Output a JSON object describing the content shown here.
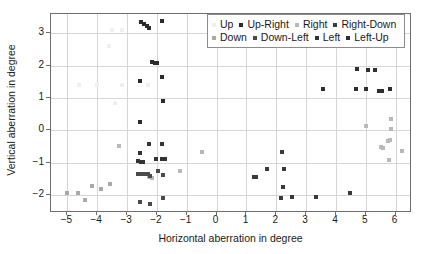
{
  "chart_data": {
    "type": "scatter",
    "title": "",
    "xlabel": "Horizontal aberration in degree",
    "ylabel": "Vertical aberration in degree",
    "xlim": [
      -5.55,
      6.55
    ],
    "ylim": [
      -2.55,
      3.6
    ],
    "xticks": [
      -5,
      -4,
      -3,
      -2,
      -1,
      0,
      1,
      2,
      3,
      4,
      5,
      6
    ],
    "xticklabels": [
      "−5",
      "−4",
      "−3",
      "−2",
      "−1",
      "0",
      "1",
      "2",
      "3",
      "4",
      "5",
      "6"
    ],
    "yticks": [
      -2,
      -1,
      0,
      1,
      2,
      3
    ],
    "yticklabels": [
      "−2",
      "−1",
      "0",
      "1",
      "2",
      "3"
    ],
    "grid": true,
    "legend_position": "upper right",
    "marker": "square",
    "series": [
      {
        "name": "Up",
        "color": "#efefef",
        "points": [
          [
            -3.52,
            3.1
          ],
          [
            -3.18,
            3.1
          ],
          [
            -3.6,
            2.62
          ],
          [
            -4.62,
            1.4
          ],
          [
            -4.02,
            1.4
          ],
          [
            -3.18,
            1.4
          ],
          [
            -2.3,
            1.4
          ],
          [
            -3.42,
            0.84
          ]
        ]
      },
      {
        "name": "Up-Right",
        "color": "#2b2b2b",
        "points": [
          [
            -2.52,
            3.34
          ],
          [
            -2.42,
            3.3
          ],
          [
            -2.34,
            3.24
          ],
          [
            -2.28,
            3.17
          ],
          [
            -1.82,
            3.38
          ],
          [
            -2.16,
            2.13
          ],
          [
            -2.08,
            2.09
          ],
          [
            -2.0,
            2.1
          ],
          [
            -2.56,
            1.52
          ],
          [
            -1.82,
            1.64
          ],
          [
            -1.8,
            0.9
          ],
          [
            -2.58,
            0.26
          ]
        ]
      },
      {
        "name": "Right",
        "color": "#b9b9b9",
        "points": [
          [
            -3.28,
            -0.49
          ],
          [
            -1.22,
            -1.24
          ],
          [
            -0.48,
            -0.66
          ],
          [
            -2.26,
            -1.44
          ],
          [
            -2.18,
            -1.47
          ],
          [
            5.02,
            0.13
          ],
          [
            5.86,
            0.36
          ],
          [
            5.84,
            0.06
          ],
          [
            5.8,
            -0.3
          ],
          [
            5.74,
            -0.33
          ],
          [
            5.52,
            -0.52
          ],
          [
            5.58,
            -0.55
          ],
          [
            6.22,
            -0.62
          ],
          [
            5.78,
            -0.92
          ]
        ]
      },
      {
        "name": "Right-Down",
        "color": "#3a3a3a",
        "points": [
          [
            2.18,
            -0.67
          ],
          [
            1.7,
            -1.19
          ],
          [
            2.26,
            -1.19
          ],
          [
            1.27,
            -1.44
          ],
          [
            1.31,
            -1.45
          ],
          [
            2.24,
            -1.76
          ],
          [
            2.16,
            -2.1
          ],
          [
            2.52,
            -2.06
          ],
          [
            3.34,
            -2.06
          ],
          [
            4.48,
            -1.94
          ]
        ]
      },
      {
        "name": "Down",
        "color": "#a9a9a9",
        "points": [
          [
            -5.02,
            -1.93
          ],
          [
            -4.66,
            -1.93
          ],
          [
            -4.42,
            -2.15
          ],
          [
            -4.16,
            -1.71
          ],
          [
            -3.88,
            -1.81
          ],
          [
            -3.58,
            -1.66
          ]
        ]
      },
      {
        "name": "Down-Left",
        "color": "#4a4a4a",
        "points": [
          [
            -2.62,
            -1.33
          ],
          [
            -2.54,
            -1.33
          ],
          [
            -2.46,
            -1.34
          ],
          [
            -2.38,
            -1.34
          ],
          [
            -2.3,
            -1.35
          ],
          [
            -2.22,
            -1.41
          ],
          [
            -1.98,
            -1.24
          ],
          [
            -1.8,
            -1.39
          ],
          [
            -2.58,
            -2.21
          ],
          [
            -2.22,
            -2.28
          ],
          [
            -1.8,
            -2.08
          ]
        ]
      },
      {
        "name": "Left",
        "color": "#333333",
        "points": [
          [
            -2.58,
            -0.7
          ],
          [
            -2.62,
            -0.95
          ],
          [
            -2.54,
            -0.96
          ],
          [
            -2.46,
            -0.96
          ],
          [
            -2.26,
            -0.43
          ],
          [
            -1.82,
            -0.41
          ],
          [
            -2.02,
            -0.89
          ],
          [
            -1.82,
            -0.88
          ],
          [
            -1.72,
            -0.88
          ]
        ]
      },
      {
        "name": "Left-Up",
        "color": "#2f2f2f",
        "points": [
          [
            4.7,
            1.91
          ],
          [
            5.08,
            1.86
          ],
          [
            5.32,
            1.86
          ],
          [
            4.68,
            1.27
          ],
          [
            5.0,
            1.28
          ],
          [
            5.46,
            1.21
          ],
          [
            5.56,
            1.23
          ],
          [
            5.82,
            1.27
          ],
          [
            3.56,
            1.27
          ]
        ]
      }
    ]
  },
  "legend": {
    "row1": [
      {
        "label": "Up",
        "color": "#efefef"
      },
      {
        "label": "Up-Right",
        "color": "#2b2b2b"
      },
      {
        "label": "Right",
        "color": "#b9b9b9"
      },
      {
        "label": "Right-Down",
        "color": "#3a3a3a"
      }
    ],
    "row2": [
      {
        "label": "Down",
        "color": "#a9a9a9"
      },
      {
        "label": "Down-Left",
        "color": "#4a4a4a"
      },
      {
        "label": "Left",
        "color": "#333333"
      },
      {
        "label": "Left-Up",
        "color": "#2f2f2f"
      }
    ]
  }
}
